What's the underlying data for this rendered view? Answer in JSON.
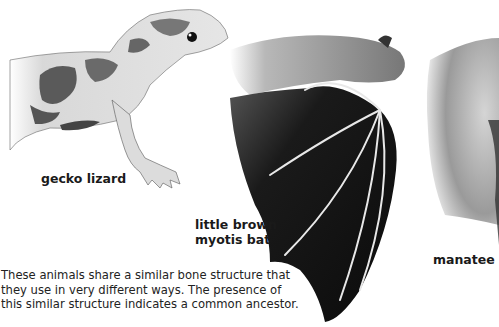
{
  "figure": {
    "animals": [
      {
        "id": "gecko",
        "label": "gecko lizard"
      },
      {
        "id": "bat",
        "label": "little brown myotis bat"
      },
      {
        "id": "manatee",
        "label": "manatee"
      }
    ],
    "labels": {
      "gecko": "gecko lizard",
      "bat_line1": "little brown",
      "bat_line2": "myotis bat",
      "manatee": "manatee"
    },
    "caption": "These animals share a similar bone structure that they use in very different ways. The presence of this similar structure indicates a common ancestor."
  }
}
